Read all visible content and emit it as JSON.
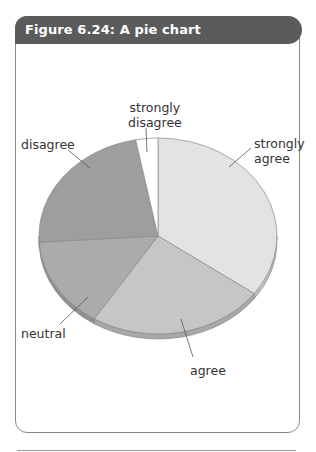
{
  "figure": {
    "title": "Figure 6.24: A pie chart"
  },
  "chart_data": {
    "type": "pie",
    "title": "Figure 6.24: A pie chart",
    "style": "3d-tilted",
    "start_angle": "12 o'clock, clockwise",
    "categories": [
      "strongly agree",
      "agree",
      "neutral",
      "disagree",
      "strongly disagree"
    ],
    "values": [
      35,
      24,
      15,
      23,
      3
    ],
    "unit": "percent (estimated from slice angles)",
    "colors": [
      "#e3e3e3",
      "#c6c6c6",
      "#ababab",
      "#9e9e9e",
      "#ffffff"
    ],
    "legend": "none (direct labels with leader lines)"
  },
  "labels": {
    "strongly_agree": [
      "strongly",
      "agree"
    ],
    "agree": "agree",
    "neutral": "neutral",
    "disagree": "disagree",
    "strongly_disagree": [
      "strongly",
      "disagree"
    ]
  }
}
